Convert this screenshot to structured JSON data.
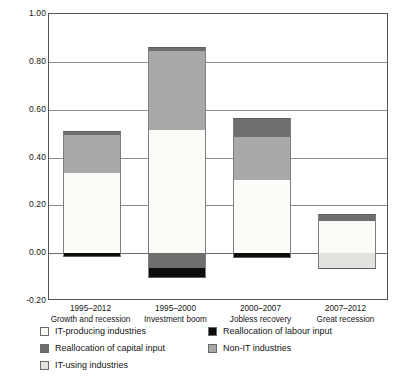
{
  "chart_data": {
    "type": "bar",
    "subtype": "stacked-bar-with-negatives",
    "title": "",
    "xlabel": "",
    "ylabel": "",
    "ylim": [
      -0.2,
      1.0
    ],
    "ytick_values": [
      1.0,
      0.8,
      0.6,
      0.4,
      0.2,
      0.0,
      -0.2
    ],
    "ytick_labels": [
      "1.00",
      "0.80",
      "0.60",
      "0.40",
      "0.20",
      "0.00",
      "-0.20"
    ],
    "grid": true,
    "legend_position": "below",
    "categories": [
      {
        "period": "1995–2012",
        "name": "Growth and recession"
      },
      {
        "period": "1995–2000",
        "name": "Investment boom"
      },
      {
        "period": "2000–2007",
        "name": "Jobless recovery"
      },
      {
        "period": "2007–2012",
        "name": "Great recession"
      }
    ],
    "series": [
      {
        "name": "IT-producing industries",
        "key": "itprod",
        "color": "#fbfbf7",
        "values": [
          0.335,
          0.615,
          0.325,
          0.135
        ]
      },
      {
        "name": "IT-using industries",
        "key": "itusing",
        "color": "#e2e2df",
        "values": [
          0.0,
          0.0,
          0.0,
          -0.065
        ]
      },
      {
        "name": "Non-IT industries",
        "key": "nonit",
        "color": "#a9a9a9",
        "values": [
          0.175,
          0.345,
          0.185,
          0.0
        ]
      },
      {
        "name": "Reallocation of capital input",
        "key": "capital",
        "color": "#6e6e6e",
        "values": [
          0.0,
          -0.065,
          0.08,
          0.03
        ]
      },
      {
        "name": "Reallocation of labour input",
        "key": "labour",
        "color": "#0d0d0d",
        "values": [
          -0.015,
          -0.045,
          -0.02,
          0.0
        ]
      }
    ],
    "totals": [
      0.51,
      0.855,
      0.565,
      0.165
    ],
    "annotations": []
  },
  "yaxis": {
    "ticks": [
      {
        "label": "1.00",
        "value": 1.0
      },
      {
        "label": "0.80",
        "value": 0.8
      },
      {
        "label": "0.60",
        "value": 0.6
      },
      {
        "label": "0.40",
        "value": 0.4
      },
      {
        "label": "0.20",
        "value": 0.2
      },
      {
        "label": "0.00",
        "value": 0.0
      },
      {
        "label": "-0.20",
        "value": -0.2
      }
    ]
  },
  "xaxis": {
    "labels": [
      {
        "period": "1995–2012",
        "name": "Growth and recession"
      },
      {
        "period": "1995–2000",
        "name": "Investment boom"
      },
      {
        "period": "2000–2007",
        "name": "Jobless recovery"
      },
      {
        "period": "2007–2012",
        "name": "Great recession"
      }
    ]
  },
  "legend": {
    "items": [
      {
        "label": "IT-producing industries",
        "color": "#fbfbf7",
        "swatch": "itprod"
      },
      {
        "label": "Reallocation of labour input",
        "color": "#0d0d0d",
        "swatch": "labour"
      },
      {
        "label": "Reallocation of capital input",
        "color": "#6e6e6e",
        "swatch": "capital"
      },
      {
        "label": "Non-IT industries",
        "color": "#a9a9a9",
        "swatch": "nonit"
      },
      {
        "label": "IT-using industries",
        "color": "#e2e2df",
        "swatch": "itusing"
      }
    ]
  },
  "bars": [
    {
      "category": "1995–2012",
      "total": 0.51,
      "segments": [
        {
          "key": "nonit",
          "from": 0.335,
          "to": 0.495
        },
        {
          "key": "capital",
          "from": 0.495,
          "to": 0.51
        },
        {
          "key": "itprod",
          "from": 0.0,
          "to": 0.335
        },
        {
          "key": "labour",
          "from": -0.018,
          "to": 0.0
        }
      ]
    },
    {
      "category": "1995–2000",
      "total": 0.855,
      "segments": [
        {
          "key": "nonit",
          "from": 0.515,
          "to": 0.845
        },
        {
          "key": "capital",
          "from": 0.845,
          "to": 0.86
        },
        {
          "key": "itprod",
          "from": 0.0,
          "to": 0.515
        },
        {
          "key": "capital",
          "from": -0.06,
          "to": 0.0
        },
        {
          "key": "labour",
          "from": -0.105,
          "to": -0.06
        }
      ]
    },
    {
      "category": "2000–2007",
      "total": 0.565,
      "segments": [
        {
          "key": "capital",
          "from": 0.485,
          "to": 0.565
        },
        {
          "key": "nonit",
          "from": 0.305,
          "to": 0.485
        },
        {
          "key": "itprod",
          "from": 0.0,
          "to": 0.305
        },
        {
          "key": "labour",
          "from": -0.022,
          "to": 0.0
        }
      ]
    },
    {
      "category": "2007–2012",
      "total": 0.165,
      "segments": [
        {
          "key": "capital",
          "from": 0.135,
          "to": 0.165
        },
        {
          "key": "itprod",
          "from": 0.0,
          "to": 0.135
        },
        {
          "key": "itusing",
          "from": -0.065,
          "to": 0.0
        }
      ]
    }
  ]
}
